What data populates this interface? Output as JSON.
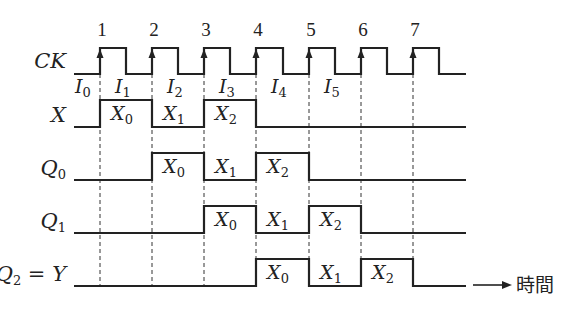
{
  "diagram": {
    "title": "",
    "time_axis_label": "時間",
    "edge_numbers": [
      "1",
      "2",
      "3",
      "4",
      "5",
      "6",
      "7"
    ],
    "edge_x": [
      100,
      152,
      204,
      256,
      309,
      361,
      413
    ],
    "signals": [
      {
        "id": "ck",
        "label_main": "CK",
        "label_sub": "",
        "label_suffix": "",
        "high_y": 48,
        "low_y": 74,
        "start_x": 74,
        "end_x": 466,
        "initial": 0,
        "transitions": [
          100,
          126,
          152,
          178,
          204,
          230,
          256,
          283,
          309,
          335,
          361,
          387,
          413,
          439
        ],
        "segment_labels": []
      },
      {
        "id": "x",
        "label_main": "X",
        "label_sub": "",
        "label_suffix": "",
        "high_y": 100,
        "low_y": 127,
        "start_x": 74,
        "end_x": 466,
        "initial": 0,
        "transitions": [
          100,
          152,
          204,
          256
        ],
        "segment_labels": [
          {
            "base": "X",
            "sub": "0",
            "x": 126
          },
          {
            "base": "X",
            "sub": "1",
            "x": 178
          },
          {
            "base": "X",
            "sub": "2",
            "x": 230
          }
        ]
      },
      {
        "id": "q0",
        "label_main": "Q",
        "label_sub": "0",
        "label_suffix": "",
        "high_y": 153,
        "low_y": 180,
        "start_x": 74,
        "end_x": 466,
        "initial": 0,
        "transitions": [
          152,
          204,
          256,
          309
        ],
        "segment_labels": [
          {
            "base": "X",
            "sub": "0",
            "x": 178
          },
          {
            "base": "X",
            "sub": "1",
            "x": 230
          },
          {
            "base": "X",
            "sub": "2",
            "x": 282
          }
        ]
      },
      {
        "id": "q1",
        "label_main": "Q",
        "label_sub": "1",
        "label_suffix": "",
        "high_y": 206,
        "low_y": 233,
        "start_x": 74,
        "end_x": 466,
        "initial": 0,
        "transitions": [
          204,
          256,
          309,
          361
        ],
        "segment_labels": [
          {
            "base": "X",
            "sub": "0",
            "x": 230
          },
          {
            "base": "X",
            "sub": "1",
            "x": 282
          },
          {
            "base": "X",
            "sub": "2",
            "x": 335
          }
        ]
      },
      {
        "id": "q2",
        "label_main": "Q",
        "label_sub": "2",
        "label_suffix": " = Y",
        "high_y": 259,
        "low_y": 286,
        "start_x": 74,
        "end_x": 466,
        "initial": 0,
        "transitions": [
          256,
          309,
          361,
          413
        ],
        "segment_labels": [
          {
            "base": "X",
            "sub": "0",
            "x": 282
          },
          {
            "base": "X",
            "sub": "1",
            "x": 335
          },
          {
            "base": "X",
            "sub": "2",
            "x": 387
          }
        ]
      }
    ],
    "input_intervals": [
      {
        "base": "I",
        "sub": "0",
        "x": 86
      },
      {
        "base": "I",
        "sub": "1",
        "x": 126
      },
      {
        "base": "I",
        "sub": "2",
        "x": 178
      },
      {
        "base": "I",
        "sub": "3",
        "x": 230
      },
      {
        "base": "I",
        "sub": "4",
        "x": 282
      },
      {
        "base": "I",
        "sub": "5",
        "x": 335
      }
    ]
  }
}
